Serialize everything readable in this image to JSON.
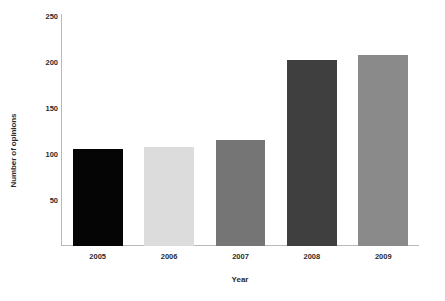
{
  "chart_data": {
    "type": "bar",
    "title": "",
    "subtitle": "",
    "xlabel": "Year",
    "ylabel": "Number of opinions",
    "categories": [
      "2005",
      "2006",
      "2007",
      "2008",
      "2009"
    ],
    "values": [
      105,
      108,
      115,
      202,
      208
    ],
    "series": [
      {
        "name": "Number of opinions",
        "values": [
          105,
          108,
          115,
          202,
          208
        ]
      }
    ],
    "bar_colors": [
      "#050505",
      "#dcdcdc",
      "#757575",
      "#3f3f3f",
      "#8a8a8a"
    ],
    "ylim": [
      0,
      250
    ],
    "ytick_labels": [
      "250",
      "200",
      "150",
      "100",
      "50"
    ],
    "ytick_values": [
      250,
      200,
      150,
      100,
      50
    ],
    "xtick_labels": [
      "2005",
      "2006",
      "2007",
      "2008",
      "2009"
    ],
    "grid": false,
    "legend": false,
    "legend_position": "none",
    "axis_color": "#b9b9b9",
    "text_color": "#2b2b2b",
    "background": "#ffffff"
  }
}
